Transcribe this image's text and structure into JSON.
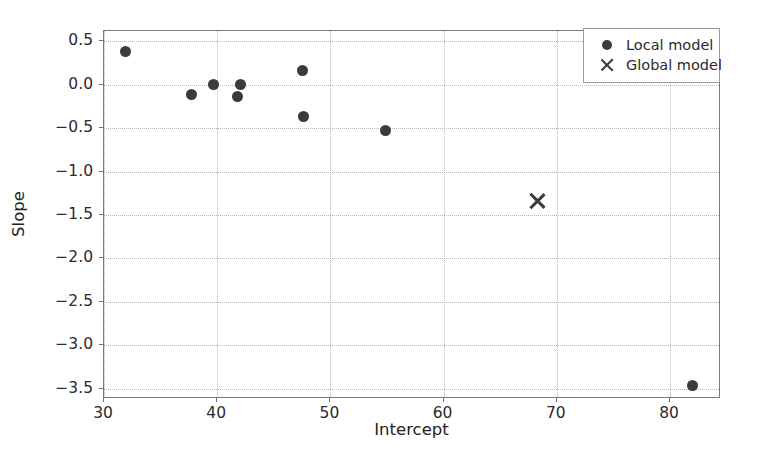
{
  "chart_data": {
    "type": "scatter",
    "title": "",
    "xlabel": "Intercept",
    "ylabel": "Slope",
    "xlim": [
      30,
      84.5
    ],
    "ylim": [
      -3.62,
      0.62
    ],
    "xticks": [
      30,
      40,
      50,
      60,
      70,
      80
    ],
    "xtick_labels": [
      "30",
      "40",
      "50",
      "60",
      "70",
      "80"
    ],
    "yticks": [
      0.5,
      0.0,
      -0.5,
      -1.0,
      -1.5,
      -2.0,
      -2.5,
      -3.0,
      -3.5
    ],
    "ytick_labels": [
      "0.5",
      "0.0",
      "−0.5",
      "−1.0",
      "−1.5",
      "−2.0",
      "−2.5",
      "−3.0",
      "−3.5"
    ],
    "grid": true,
    "grid_style": "dotted",
    "legend_position": "upper right",
    "marker_color": "#3b3b3b",
    "grid_color": "#b9b9b9",
    "axis_color": "#7a7a7a",
    "series": [
      {
        "name": "Local model",
        "marker": "circle",
        "color": "#3b3b3b",
        "points": [
          {
            "x": 31.9,
            "y": 0.38
          },
          {
            "x": 37.7,
            "y": -0.11
          },
          {
            "x": 39.7,
            "y": 0.0
          },
          {
            "x": 41.8,
            "y": -0.13
          },
          {
            "x": 42.1,
            "y": 0.0
          },
          {
            "x": 47.5,
            "y": 0.17
          },
          {
            "x": 47.6,
            "y": -0.36
          },
          {
            "x": 54.9,
            "y": -0.53
          },
          {
            "x": 82.0,
            "y": -3.47
          }
        ]
      },
      {
        "name": "Global model",
        "marker": "x",
        "color": "#3b3b3b",
        "points": [
          {
            "x": 68.3,
            "y": -1.34
          }
        ]
      }
    ]
  },
  "legend": {
    "entries": [
      {
        "label": "Local model",
        "marker": "circle"
      },
      {
        "label": "Global model",
        "marker": "x"
      }
    ]
  }
}
